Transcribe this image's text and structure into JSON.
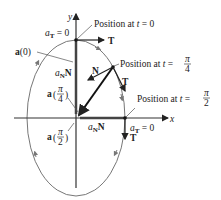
{
  "diagram": {
    "type": "elliptical-motion-acceleration",
    "axes": {
      "x_label": "x",
      "y_label": "y"
    },
    "ellipse": {
      "center": [
        76,
        118
      ],
      "rx": 49,
      "ry": 78,
      "stroke": "#777777"
    },
    "labels": {
      "pos_t0": "Position at t = 0",
      "pos_t0_prefix": "Position at ",
      "pos_t0_t": "t",
      "pos_t0_eq": " = 0",
      "pos_pi4_prefix": "Position at ",
      "pos_pi4_t": "t",
      "pos_pi4_eq": " = ",
      "pi": "π",
      "four": "4",
      "two": "2",
      "pos_pi2_prefix": "Position at ",
      "pos_pi2_t": "t",
      "pos_pi2_eq": " = ",
      "aT0_top_a": "a",
      "aT0_top_sub": "T",
      "aT0_top_eq": " = 0",
      "aT0_right_a": "a",
      "aT0_right_sub": "T",
      "aT0_right_eq": " = 0",
      "a0": "a",
      "a0_arg": "(0)",
      "aN_top": "a",
      "aN_top_sub": "N",
      "aN_top_N": "N",
      "aN_right": "a",
      "aN_right_sub": "N",
      "aN_right_N": "N",
      "N": "N",
      "T_top": "T",
      "T_mid": "T",
      "T_right": "T",
      "a_pi4": "a",
      "a_pi2": "a"
    },
    "colors": {
      "axis": "#333333",
      "vector": "#111111",
      "curve": "#777777",
      "leader": "#555555"
    }
  }
}
